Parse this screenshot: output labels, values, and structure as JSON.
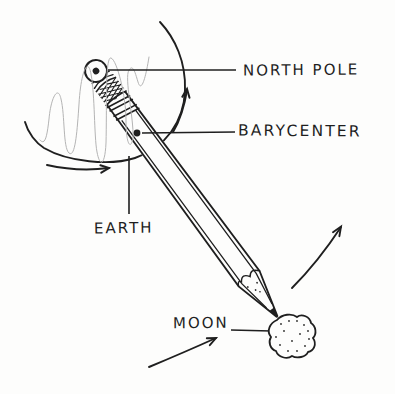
{
  "diagram": {
    "kind": "hand-drawn physics illustration",
    "labels": {
      "north_pole": "NORTH POLE",
      "barycenter": "BARYCENTER",
      "earth": "EARTH",
      "moon": "MOON"
    },
    "shapes": [
      "earth-outline-arc",
      "earth-spin-scribble",
      "pencil",
      "pencil-eraser-end",
      "ferrule-crosshatch-band",
      "pencil-stripes",
      "pencil-tip",
      "barycenter-dot",
      "moon-rock",
      "earth-rotation-arrow-right",
      "earth-rotation-arrow-bottom",
      "moon-orbit-arrow-upper",
      "moon-orbit-arrow-lower"
    ],
    "colors": {
      "ink": "#1f1f1f",
      "paper": "#fdfdfc",
      "scribble": "#b4b4b4"
    }
  }
}
